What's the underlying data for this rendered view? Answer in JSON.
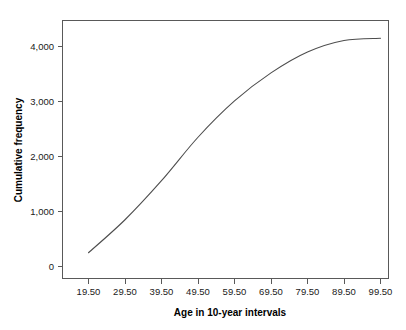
{
  "chart_data": {
    "type": "line",
    "title": "",
    "subtitle": "",
    "xlabel": "Age in 10-year intervals",
    "ylabel": "Cumulative frequency",
    "x": [
      19.5,
      29.5,
      39.5,
      49.5,
      59.5,
      69.5,
      79.5,
      89.5,
      99.5
    ],
    "values": [
      250,
      850,
      1560,
      2350,
      3010,
      3520,
      3900,
      4110,
      4150
    ],
    "series": [
      {
        "name": "Cumulative frequency",
        "values": [
          250,
          850,
          1560,
          2350,
          3010,
          3520,
          3900,
          4110,
          4150
        ]
      }
    ],
    "xtick_labels": [
      "19.50",
      "29.50",
      "39.50",
      "49.50",
      "59.50",
      "69.50",
      "79.50",
      "89.50",
      "99.50"
    ],
    "ytick_labels": [
      "0",
      "1,000",
      "2,000",
      "3,000",
      "4,000"
    ],
    "ytick_values": [
      0,
      1000,
      2000,
      3000,
      4000
    ],
    "xlim": [
      14.5,
      104.5
    ],
    "ylim": [
      -250,
      4700
    ],
    "grid": false,
    "legend": false,
    "legend_position": "none",
    "line_color": "#4d4d4d",
    "frame_color": "#595959",
    "background_color": "#ffffff"
  },
  "axes": {
    "y_title": "Cumulative frequency",
    "x_title": "Age in 10-year intervals"
  },
  "y_ticks": [
    {
      "label": "4,000",
      "value": 4000
    },
    {
      "label": "3,000",
      "value": 3000
    },
    {
      "label": "2,000",
      "value": 2000
    },
    {
      "label": "1,000",
      "value": 1000
    },
    {
      "label": "0",
      "value": 0
    }
  ],
  "x_ticks": [
    {
      "label": "19.50",
      "value": 19.5
    },
    {
      "label": "29.50",
      "value": 29.5
    },
    {
      "label": "39.50",
      "value": 39.5
    },
    {
      "label": "49.50",
      "value": 49.5
    },
    {
      "label": "59.50",
      "value": 59.5
    },
    {
      "label": "69.50",
      "value": 69.5
    },
    {
      "label": "79.50",
      "value": 79.5
    },
    {
      "label": "89.50",
      "value": 89.5
    },
    {
      "label": "99.50",
      "value": 99.5
    }
  ]
}
